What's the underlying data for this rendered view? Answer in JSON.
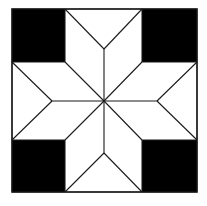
{
  "figure": {
    "title": "",
    "colors": {
      "background": "#ffffff",
      "corner_fill": "#000000",
      "diamond_fill": "#ffffff",
      "line": "#1a1a1a"
    },
    "outer_square": {
      "x": 12,
      "y": 9,
      "size": 185
    },
    "center": {
      "x": 104,
      "y": 101
    },
    "corner_squares": [
      {
        "name": "top-left",
        "x": 12,
        "y": 9,
        "w": 53,
        "h": 53
      },
      {
        "name": "top-right",
        "x": 142,
        "y": 9,
        "w": 55,
        "h": 53
      },
      {
        "name": "bottom-left",
        "x": 12,
        "y": 140,
        "w": 53,
        "h": 52
      },
      {
        "name": "bottom-right",
        "x": 142,
        "y": 140,
        "w": 55,
        "h": 52
      }
    ],
    "star_tips": {
      "top": {
        "x": 104,
        "y": 49
      },
      "bottom": {
        "x": 104,
        "y": 153
      },
      "left": {
        "x": 52,
        "y": 101
      },
      "right": {
        "x": 157,
        "y": 101
      }
    },
    "diamond_count": 8
  }
}
